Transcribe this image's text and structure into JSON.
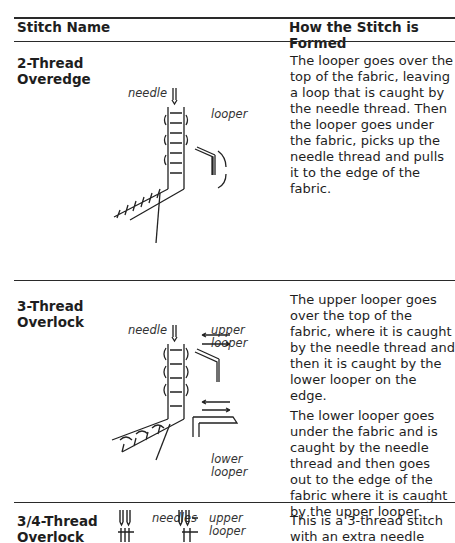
{
  "table": {
    "headers": {
      "name": "Stitch Name",
      "how": "How the Stitch is Formed"
    },
    "rows": [
      {
        "name_line1": "2-Thread",
        "name_line2": "Overedge",
        "labels": {
          "needle": "needle",
          "looper": "looper"
        },
        "description": [
          "The looper goes over the top of the fabric, leaving a loop that is caught by the needle thread. Then the looper goes under the fabric, picks up the needle thread and pulls it to the edge of the fabric."
        ]
      },
      {
        "name_line1": "3-Thread",
        "name_line2": "Overlock",
        "labels": {
          "needle": "needle",
          "upper1": "upper",
          "upper2": "looper",
          "lower1": "lower",
          "lower2": "looper"
        },
        "description": [
          "The upper looper goes over the top of the fabric, where it is caught by the needle thread and then it is caught by the lower looper on the edge.",
          "The lower looper goes under the fabric and is caught by the needle thread and then goes out to the edge of the fabric where it is caught by the upper looper."
        ]
      },
      {
        "name_line1": "3/4-Thread",
        "name_line2": "Overlock",
        "labels": {
          "needles": "needles",
          "upper1": "upper",
          "upper2": "looper"
        },
        "description": [
          "This is a 3-thread stitch with an extra needle"
        ]
      }
    ]
  }
}
